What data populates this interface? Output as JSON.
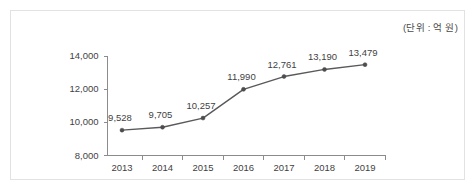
{
  "annotations": {
    "unit_note": "(단위 : 억 원)"
  },
  "chart_data": {
    "type": "line",
    "title": "",
    "subtitle": "",
    "xlabel": "",
    "ylabel": "",
    "unit_note": "(단위 : 억 원)",
    "categories": [
      "2013",
      "2014",
      "2015",
      "2016",
      "2017",
      "2018",
      "2019"
    ],
    "values": [
      9528,
      9705,
      10257,
      11990,
      12761,
      13190,
      13479
    ],
    "point_labels": [
      "9,528",
      "9,705",
      "10,257",
      "11,990",
      "12,761",
      "13,190",
      "13,479"
    ],
    "ylim": [
      8000,
      14000
    ],
    "yticks": [
      8000,
      10000,
      12000,
      14000
    ],
    "ytick_labels": [
      "8,000",
      "10,000",
      "12,000",
      "14,000"
    ],
    "grid": false,
    "legend": null,
    "legend_position": "none",
    "marker": "circle",
    "series": [
      {
        "name": "",
        "values": [
          9528,
          9705,
          10257,
          11990,
          12761,
          13190,
          13479
        ]
      }
    ],
    "colors": {
      "line": "#595959",
      "marker": "#4d4d4d",
      "axis": "#8c8c8c",
      "text": "#3f3f3f",
      "frame": "#e2e2e2",
      "background": "#ffffff"
    }
  }
}
